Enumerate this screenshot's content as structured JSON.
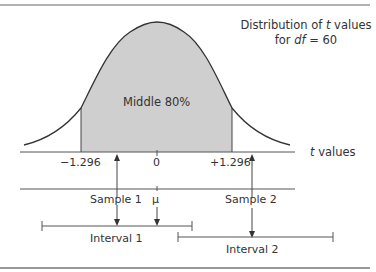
{
  "title": {
    "line1_prefix": "Distribution of ",
    "line1_var": "t",
    "line1_suffix": " values",
    "line2_prefix": "for ",
    "line2_var": "df",
    "line2_suffix": " = 60"
  },
  "region_label": "Middle 80%",
  "axis": {
    "label_var": "t",
    "label_suffix": " values",
    "ticks": [
      "−1.296",
      "0",
      "+1.296"
    ]
  },
  "samples": {
    "sample1": "Sample 1",
    "sample2": "Sample 2",
    "mu": "μ"
  },
  "intervals": {
    "interval1": "Interval 1",
    "interval2": "Interval 2"
  },
  "colors": {
    "shade": "#cfcfcf",
    "line": "#444444",
    "border": "#888888"
  }
}
